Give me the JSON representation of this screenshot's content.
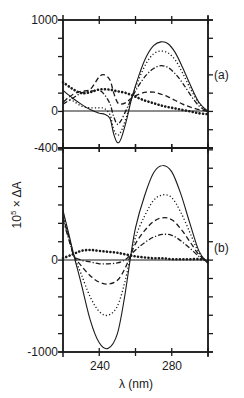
{
  "chart_data": [
    {
      "panel": "(a)",
      "type": "line",
      "title": "",
      "xlabel": "λ (nm)",
      "ylabel": "10^5 × ΔA",
      "xlim": [
        220,
        300
      ],
      "ylim": [
        -400,
        1000
      ],
      "y_tick_labels": [
        "1000",
        "0",
        "-400"
      ],
      "y_tick_values": [
        1000,
        0,
        -400
      ],
      "y_minor_step": 200,
      "x_ticks": [
        240,
        260,
        280,
        300
      ],
      "grid": false,
      "series": [
        {
          "name": "solid",
          "style": "solid",
          "x": [
            220,
            225,
            230,
            235,
            240,
            243,
            246,
            248,
            250,
            252,
            255,
            258,
            262,
            266,
            270,
            274,
            278,
            282,
            286,
            290,
            295,
            300
          ],
          "values": [
            230,
            150,
            80,
            20,
            -20,
            -30,
            -80,
            -250,
            -340,
            -300,
            -100,
            150,
            400,
            600,
            720,
            760,
            740,
            640,
            480,
            300,
            100,
            0
          ]
        },
        {
          "name": "dotted",
          "style": "dotted",
          "x": [
            220,
            225,
            230,
            235,
            240,
            243,
            246,
            248,
            250,
            252,
            255,
            258,
            262,
            266,
            270,
            274,
            278,
            282,
            286,
            290,
            295,
            300
          ],
          "values": [
            150,
            120,
            60,
            40,
            40,
            30,
            -40,
            -200,
            -260,
            -220,
            -60,
            150,
            360,
            530,
            630,
            660,
            640,
            560,
            420,
            260,
            90,
            0
          ]
        },
        {
          "name": "dash-dot",
          "style": "dashdot",
          "x": [
            220,
            225,
            230,
            235,
            240,
            243,
            246,
            248,
            250,
            252,
            255,
            258,
            262,
            266,
            270,
            274,
            278,
            282,
            286,
            290,
            295,
            300
          ],
          "values": [
            80,
            140,
            200,
            220,
            230,
            180,
            80,
            -60,
            -140,
            -100,
            20,
            150,
            290,
            400,
            470,
            500,
            480,
            410,
            310,
            190,
            60,
            0
          ]
        },
        {
          "name": "dashed",
          "style": "dashed",
          "x": [
            220,
            225,
            230,
            235,
            240,
            243,
            246,
            248,
            250,
            252,
            255,
            258,
            262,
            266,
            270,
            274,
            278,
            282,
            286,
            290,
            295,
            300
          ],
          "values": [
            100,
            180,
            220,
            240,
            380,
            400,
            340,
            200,
            100,
            80,
            100,
            150,
            190,
            210,
            210,
            190,
            160,
            120,
            80,
            50,
            20,
            0
          ]
        },
        {
          "name": "circles",
          "style": "thick-dotted",
          "x": [
            220,
            225,
            230,
            235,
            240,
            245,
            250,
            255,
            260,
            265,
            270,
            275,
            280,
            285,
            290,
            295,
            300
          ],
          "values": [
            320,
            250,
            200,
            210,
            240,
            240,
            220,
            200,
            160,
            120,
            90,
            60,
            40,
            20,
            0,
            -20,
            -30
          ]
        }
      ]
    },
    {
      "panel": "(b)",
      "type": "line",
      "title": "",
      "xlabel": "λ (nm)",
      "ylabel": "10^5 × ΔA",
      "xlim": [
        220,
        300
      ],
      "ylim": [
        -1000,
        1220
      ],
      "y_tick_labels": [
        "0",
        "-1000"
      ],
      "y_tick_values": [
        0,
        -1000
      ],
      "y_minor_step": 200,
      "x_ticks": [
        240,
        260,
        280,
        300
      ],
      "x_tick_labels": [
        "240",
        "280"
      ],
      "grid": false,
      "series": [
        {
          "name": "solid",
          "style": "solid",
          "x": [
            220,
            223,
            226,
            230,
            235,
            240,
            245,
            250,
            254,
            257,
            260,
            265,
            270,
            275,
            280,
            285,
            290,
            295,
            300
          ],
          "values": [
            540,
            300,
            50,
            -250,
            -650,
            -900,
            -960,
            -800,
            -400,
            0,
            350,
            700,
            950,
            1030,
            960,
            720,
            400,
            100,
            -40
          ]
        },
        {
          "name": "dotted",
          "style": "dotted",
          "x": [
            220,
            223,
            226,
            230,
            235,
            240,
            245,
            250,
            254,
            257,
            260,
            265,
            270,
            275,
            280,
            285,
            290,
            295,
            300
          ],
          "values": [
            500,
            280,
            50,
            -150,
            -400,
            -560,
            -600,
            -500,
            -250,
            20,
            250,
            480,
            650,
            710,
            680,
            520,
            300,
            80,
            -30
          ]
        },
        {
          "name": "dashed",
          "style": "dashed",
          "x": [
            220,
            223,
            226,
            230,
            235,
            240,
            245,
            250,
            254,
            257,
            260,
            265,
            270,
            275,
            280,
            285,
            290,
            295,
            300
          ],
          "values": [
            470,
            260,
            50,
            -60,
            -170,
            -240,
            -260,
            -220,
            -100,
            40,
            180,
            320,
            420,
            460,
            440,
            340,
            200,
            60,
            -20
          ]
        },
        {
          "name": "dash-dot",
          "style": "dashdot",
          "x": [
            220,
            223,
            226,
            230,
            235,
            240,
            245,
            250,
            254,
            257,
            260,
            265,
            270,
            275,
            280,
            285,
            290,
            295,
            300
          ],
          "values": [
            440,
            240,
            50,
            0,
            -20,
            -40,
            -40,
            -30,
            0,
            50,
            110,
            190,
            250,
            280,
            270,
            210,
            130,
            40,
            -20
          ]
        },
        {
          "name": "circles",
          "style": "thick-dotted",
          "x": [
            220,
            225,
            230,
            235,
            240,
            245,
            250,
            255,
            260,
            265,
            270,
            275,
            280,
            285,
            290,
            295,
            300
          ],
          "values": [
            20,
            60,
            100,
            110,
            100,
            90,
            80,
            60,
            40,
            30,
            20,
            20,
            10,
            10,
            10,
            10,
            0
          ]
        }
      ]
    }
  ],
  "labels": {
    "panel_a": "(a)",
    "panel_b": "(b)",
    "y_axis_title_base": "10",
    "y_axis_title_exp": "5",
    "y_axis_title_rest": " × ΔA",
    "x_axis_title": "λ (nm)",
    "y_top_max": "1000",
    "y_top_zero": "0",
    "y_top_min": "-400",
    "y_bottom_zero": "0",
    "y_bottom_min": "-1000",
    "x_tick_240": "240",
    "x_tick_280": "280"
  },
  "colors": {
    "ink": "#1a1a1a",
    "background": "#ffffff"
  }
}
